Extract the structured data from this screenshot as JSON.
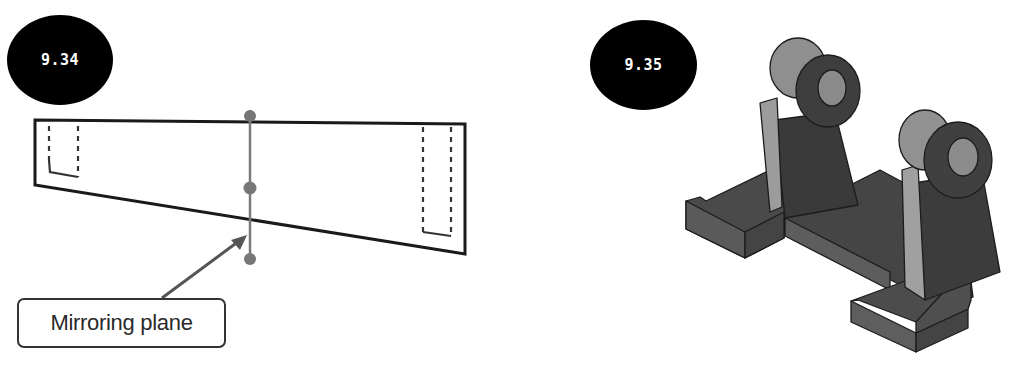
{
  "figures": [
    {
      "id": "left",
      "badge_label": "9.34",
      "callout_label": "Mirroring plane",
      "description": "2D sketch: tapered rectangular profile with dashed hidden-slot lines at each end and a vertical mirroring plane line with three point markers"
    },
    {
      "id": "right",
      "badge_label": "9.35",
      "description": "Isometric 3D model of a bracket with two upright lugs with bored bosses on a base with slotted feet"
    }
  ],
  "top_edge_text": "",
  "colors": {
    "badge_bg": "#000000",
    "badge_text": "#ffffff",
    "outline": "#1a1a1a",
    "plane_line": "#7a7a7a",
    "plane_dot": "#777777",
    "solid_dark": "#3d3d3d",
    "solid_mid": "#555555",
    "solid_light": "#9a9a9a"
  }
}
